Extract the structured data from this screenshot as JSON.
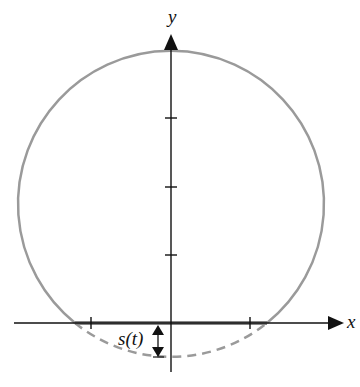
{
  "diagram": {
    "labels": {
      "x_axis": "x",
      "y_axis": "y",
      "depth": "s(t)"
    },
    "colors": {
      "circle": "#9a9a9a",
      "axes": "#111111",
      "waterline": "#888888"
    },
    "geometry": {
      "origin_px": [
        171,
        323
      ],
      "circle_center_px": [
        171,
        204
      ],
      "circle_radius_px": 153,
      "y_ticks_px": [
        118,
        187,
        255
      ],
      "x_ticks_px": [
        91,
        250
      ]
    }
  }
}
